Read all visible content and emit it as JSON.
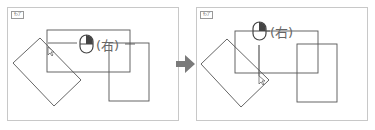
{
  "diagram": {
    "panels": [
      {
        "id": "before",
        "tag": "ｻﾝﾌﾟ",
        "mouse_label": "(右)"
      },
      {
        "id": "after",
        "tag": "ｻﾝﾌﾟ",
        "mouse_label": "(右)"
      }
    ],
    "arrow": {
      "direction": "right",
      "color": "#7a7a7a"
    },
    "colors": {
      "stroke": "#555555",
      "mouse_button": "#444444",
      "label": "#666666"
    }
  }
}
